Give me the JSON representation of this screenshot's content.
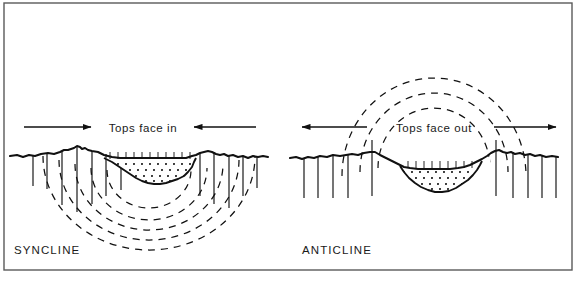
{
  "figure": {
    "kind": "geologic-cross-section-diagram",
    "background_color": "#ffffff",
    "ink_color": "#111111",
    "frame": {
      "name": "figure-border",
      "x": 4,
      "y": 3,
      "width": 568,
      "height": 267,
      "stroke": "#5a5a5a",
      "stroke_width": 1.4
    }
  },
  "panels": [
    {
      "id": "syncline",
      "title": "SYNCLINE",
      "title_x": 14,
      "title_y": 254,
      "annotation": {
        "text": "Tops face in",
        "x": 143,
        "y": 132,
        "arrow_sense": "converging-inward"
      },
      "arrows": [
        {
          "name": "tops-face-in-left-arrow",
          "x1": 24,
          "y1": 127,
          "x2": 91,
          "y2": 127,
          "head": "end",
          "direction": "right"
        },
        {
          "name": "tops-face-in-right-arrow",
          "x1": 256,
          "y1": 127,
          "x2": 194,
          "y2": 127,
          "head": "end",
          "direction": "left"
        }
      ],
      "ground_line": "M 10 156 L 17 155 L 23 157 L 29 155 L 35 156 L 41 154 L 48 153 L 54 154 L 60 152 L 64 150 L 68 150 L 71 149 L 74 148 L 77 147 L 80 147 L 82 149 L 85 148 L 88 150 L 92 151 L 98 152 L 105 154 L 112 155 L 120 156 L 128 157 L 136 158 L 145 158 L 154 158 L 162 158 L 168 157 L 172 156 L 176 156 L 180 155 L 184 153 L 188 151 L 192 151 L 196 152 L 200 153 L 204 152 L 208 151 L 212 152 L 216 154 L 220 155 L 224 154 L 228 156 L 233 155 L 238 157 L 243 156 L 248 158 L 253 156 L 258 157 L 263 156 L 268 157",
      "basin_outline": "M 104 158 L 112 162 L 118 166 L 124 170 L 130 174 L 136 178 L 142 181 L 148 183 L 154 184 L 160 184 L 166 183 L 172 181 L 178 179 L 184 176 L 188 172 L 192 167 L 194 162 L 196 158 Z",
      "basin_fill": "#ffffff",
      "stipple_rows": 4,
      "hatch_ticks_label": "bedding-tick-marks",
      "vertical_lines": [
        {
          "x": 33,
          "y1": 155,
          "y2": 186
        },
        {
          "x": 47,
          "y1": 154,
          "y2": 189
        },
        {
          "x": 62,
          "y1": 151,
          "y2": 205
        },
        {
          "x": 77,
          "y1": 147,
          "y2": 212
        },
        {
          "x": 92,
          "y1": 151,
          "y2": 204
        },
        {
          "x": 106,
          "y1": 154,
          "y2": 196
        },
        {
          "x": 121,
          "y1": 156,
          "y2": 190
        },
        {
          "x": 200,
          "y1": 153,
          "y2": 196
        },
        {
          "x": 214,
          "y1": 152,
          "y2": 204
        },
        {
          "x": 229,
          "y1": 156,
          "y2": 208
        },
        {
          "x": 243,
          "y1": 156,
          "y2": 196
        },
        {
          "x": 257,
          "y1": 157,
          "y2": 188
        }
      ],
      "dashed_arcs_label": "syncline-fold-arcs",
      "dashed_arcs_count": 5,
      "dashed_arcs": [
        {
          "cx": 149,
          "cy": 176,
          "rx": 42,
          "ry": 38,
          "top_left_y": 172,
          "top_right_y": 172
        },
        {
          "cx": 149,
          "cy": 176,
          "rx": 58,
          "ry": 52,
          "top_left_y": 168,
          "top_right_y": 168
        },
        {
          "cx": 149,
          "cy": 176,
          "rx": 74,
          "ry": 66,
          "top_left_y": 163,
          "top_right_y": 163
        },
        {
          "cx": 149,
          "cy": 176,
          "rx": 90,
          "ry": 80,
          "top_left_y": 158,
          "top_right_y": 158
        },
        {
          "cx": 149,
          "cy": 176,
          "rx": 106,
          "ry": 94,
          "top_left_y": 154,
          "top_right_y": 154
        }
      ]
    },
    {
      "id": "anticline",
      "title": "ANTICLINE",
      "title_x": 302,
      "title_y": 254,
      "annotation": {
        "text": "Tops face out",
        "x": 434,
        "y": 132,
        "arrow_sense": "diverging-outward"
      },
      "arrows": [
        {
          "name": "tops-face-out-left-arrow",
          "x1": 367,
          "y1": 127,
          "x2": 302,
          "y2": 127,
          "head": "end",
          "direction": "left"
        },
        {
          "name": "tops-face-out-right-arrow",
          "x1": 494,
          "y1": 127,
          "x2": 556,
          "y2": 127,
          "head": "end",
          "direction": "right"
        }
      ],
      "ground_line": "M 290 158 L 296 157 L 302 159 L 308 157 L 314 158 L 320 156 L 327 157 L 333 155 L 340 156 L 346 155 L 352 154 L 358 155 L 364 153 L 370 152 L 375 152 L 380 154 L 386 157 L 392 160 L 398 163 L 404 166 L 410 168 L 416 169 L 424 169 L 432 169 L 440 169 L 448 169 L 456 168 L 463 167 L 470 165 L 476 162 L 482 159 L 487 156 L 491 153 L 495 151 L 499 150 L 503 152 L 507 153 L 511 152 L 515 154 L 520 153 L 525 155 L 530 154 L 535 156 L 540 155 L 546 157 L 552 156 L 558 157",
      "basin_outline": "M 400 166 L 404 172 L 409 178 L 415 183 L 421 187 L 428 190 L 435 192 L 442 192 L 449 191 L 456 188 L 462 184 L 468 180 L 473 175 L 477 170 L 480 165 L 482 161 Z",
      "basin_fill": "#ffffff",
      "stipple_rows": 4,
      "hatch_ticks_label": "bedding-tick-marks",
      "vertical_lines": [
        {
          "x": 304,
          "y1": 158,
          "y2": 198
        },
        {
          "x": 318,
          "y1": 157,
          "y2": 198
        },
        {
          "x": 333,
          "y1": 155,
          "y2": 198
        },
        {
          "x": 348,
          "y1": 155,
          "y2": 198
        },
        {
          "x": 372,
          "y1": 140,
          "y2": 196
        },
        {
          "x": 496,
          "y1": 140,
          "y2": 196
        },
        {
          "x": 513,
          "y1": 152,
          "y2": 198
        },
        {
          "x": 528,
          "y1": 154,
          "y2": 198
        },
        {
          "x": 542,
          "y1": 155,
          "y2": 198
        },
        {
          "x": 556,
          "y1": 157,
          "y2": 198
        }
      ],
      "dashed_arcs_label": "anticline-fold-arcs",
      "dashed_arcs_count": 3,
      "dashed_arcs": [
        {
          "cx": 434,
          "cy": 158,
          "rx": 56,
          "ry": 60
        },
        {
          "cx": 434,
          "cy": 158,
          "rx": 74,
          "ry": 79
        },
        {
          "cx": 434,
          "cy": 158,
          "rx": 92,
          "ry": 98
        }
      ]
    }
  ]
}
